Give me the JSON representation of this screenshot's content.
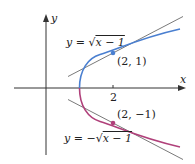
{
  "axes": {
    "x_label": "x",
    "y_label": "y",
    "x_tick": "2"
  },
  "curves": {
    "upper": {
      "eq_lhs": "y = ",
      "eq_sqrt": "√",
      "eq_inner": "x − 1",
      "color": "#4a7fd0"
    },
    "lower": {
      "eq_lhs": "y = −",
      "eq_sqrt": "√",
      "eq_inner": "x − 1",
      "color": "#b0407a"
    }
  },
  "points": {
    "upper": {
      "label": "(2, 1)"
    },
    "lower": {
      "label": "(2, −1)"
    }
  },
  "tangent_color": "#7a7a7a",
  "axis_color": "#333333"
}
